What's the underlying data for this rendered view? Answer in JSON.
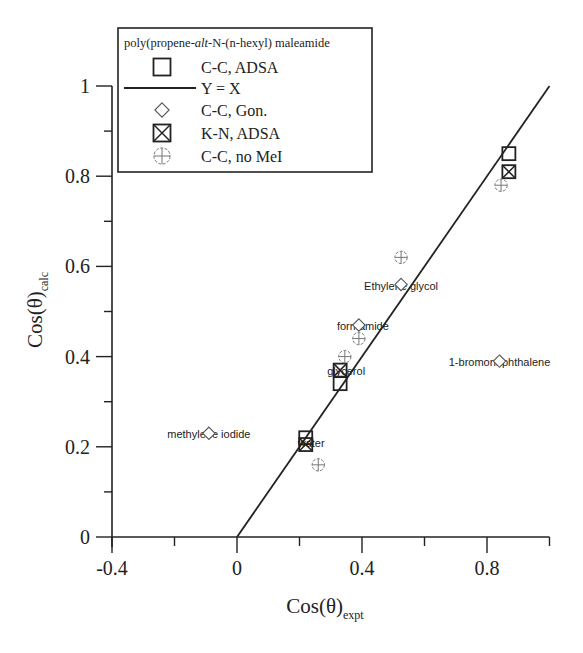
{
  "chart_data": {
    "type": "scatter",
    "title": "",
    "xlabel": "Cos(θ)",
    "xlabel_sub": "expt",
    "ylabel": "Cos(θ)",
    "ylabel_sub": "calc",
    "xlim": [
      -0.4,
      1.0
    ],
    "ylim": [
      0,
      1.0
    ],
    "xticks": [
      -0.4,
      0,
      0.4,
      0.8
    ],
    "xtick_labels": [
      "-0.4",
      "0",
      "0.4",
      "0.8"
    ],
    "yticks": [
      0,
      0.2,
      0.4,
      0.6,
      0.8,
      1
    ],
    "ytick_labels": [
      "0",
      "0.2",
      "0.4",
      "0.6",
      "0.8",
      "1"
    ],
    "grid": false,
    "legend_position": "upper-left (inside plot)",
    "legend": {
      "title_parts": [
        "poly(propene-",
        "alt",
        "-N-(n-hexyl) maleamide"
      ],
      "entries": [
        {
          "label": "C-C,  ADSA",
          "marker": "square"
        },
        {
          "label": "Y = X",
          "marker": "line"
        },
        {
          "label": "C-C, Gon.",
          "marker": "diamond"
        },
        {
          "label": "K-N, ADSA",
          "marker": "crossed-square"
        },
        {
          "label": "C-C, no MeI",
          "marker": "crossed-circle"
        }
      ]
    },
    "series": [
      {
        "name": "C-C, ADSA",
        "marker": "square",
        "points": [
          {
            "x": 0.22,
            "y": 0.22,
            "liquid": "water"
          },
          {
            "x": 0.33,
            "y": 0.34,
            "liquid": "glycerol"
          },
          {
            "x": 0.87,
            "y": 0.85,
            "liquid": ""
          }
        ]
      },
      {
        "name": "Y = X",
        "marker": "line",
        "points": [
          {
            "x": 0,
            "y": 0
          },
          {
            "x": 1,
            "y": 1
          }
        ]
      },
      {
        "name": "C-C, Gon.",
        "marker": "diamond",
        "points": [
          {
            "x": -0.09,
            "y": 0.23,
            "liquid": "methylene iodide"
          },
          {
            "x": 0.39,
            "y": 0.47,
            "liquid": "formamide"
          },
          {
            "x": 0.525,
            "y": 0.56,
            "liquid": "Ethylene glycol"
          },
          {
            "x": 0.84,
            "y": 0.39,
            "liquid": "1-bromonaphthalene"
          }
        ]
      },
      {
        "name": "K-N, ADSA",
        "marker": "crossed-square",
        "points": [
          {
            "x": 0.22,
            "y": 0.205,
            "liquid": "water"
          },
          {
            "x": 0.33,
            "y": 0.37,
            "liquid": "glycerol"
          },
          {
            "x": 0.87,
            "y": 0.81,
            "liquid": ""
          }
        ]
      },
      {
        "name": "C-C, no MeI",
        "marker": "crossed-circle",
        "points": [
          {
            "x": 0.26,
            "y": 0.16,
            "liquid": "water"
          },
          {
            "x": 0.345,
            "y": 0.4,
            "liquid": "glycerol"
          },
          {
            "x": 0.39,
            "y": 0.44,
            "liquid": "formamide"
          },
          {
            "x": 0.525,
            "y": 0.62,
            "liquid": "Ethylene glycol"
          },
          {
            "x": 0.845,
            "y": 0.78,
            "liquid": ""
          }
        ]
      }
    ],
    "annotations": [
      {
        "text": "methylene iodide",
        "x": -0.09,
        "y": 0.23
      },
      {
        "text": "water",
        "x": 0.22,
        "y": 0.21
      },
      {
        "text": "glycerol",
        "x": 0.33,
        "y": 0.37
      },
      {
        "text": "formamide",
        "x": 0.39,
        "y": 0.47
      },
      {
        "text": "Ethylene glycol",
        "x": 0.525,
        "y": 0.56
      },
      {
        "text": "1-bromonaphthalene",
        "x": 0.84,
        "y": 0.39
      }
    ]
  },
  "colors": {
    "ink": "#222222",
    "light_marker": "#777777",
    "background": "#ffffff"
  }
}
